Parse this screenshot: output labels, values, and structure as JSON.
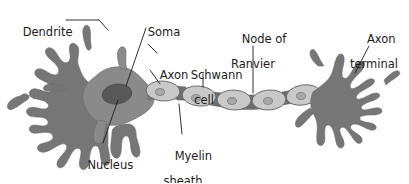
{
  "figure": {
    "background_color": "#ffffff"
  },
  "colors": {
    "dendrite": "#767676",
    "soma": "#8a8a8a",
    "nucleus": "#585858",
    "axon": "#8a8a8a",
    "schwann_cell": "#c9c9c9",
    "schwann_nucleus": "#a0a0a0",
    "node_of_ranvier": "#6e6e6e",
    "terminal": "#767676",
    "outline": "#555555",
    "leader_line": "#1c1c1c",
    "text": "#1c1c1c"
  },
  "labels": {
    "dendrite": {
      "line1": "Dendrite",
      "line2": ""
    },
    "soma": {
      "line1": "Soma",
      "line2": ""
    },
    "axon": {
      "line1": "Axon",
      "line2": ""
    },
    "schwann_cell": {
      "line1": "Schwann",
      "line2": "cell"
    },
    "node_of_ranvier": {
      "line1": "Node of",
      "line2": "Ranvier"
    },
    "axon_terminal": {
      "line1": "Axon",
      "line2": "terminal"
    },
    "nucleus": {
      "line1": "Nucleus",
      "line2": ""
    },
    "myelin_sheath": {
      "line1": "Myelin",
      "line2": "sheath"
    }
  },
  "structures": [
    {
      "name": "dendrite",
      "description": "branched dendritic tree on left of soma"
    },
    {
      "name": "soma",
      "description": "cell body, large rounded star-shaped mass"
    },
    {
      "name": "nucleus",
      "description": "dark oval inside soma"
    },
    {
      "name": "axon",
      "description": "long process extending right from soma"
    },
    {
      "name": "schwann-cell",
      "description": "five oval myelinating cells along axon"
    },
    {
      "name": "myelin-sheath",
      "description": "light oval wrapping around axon"
    },
    {
      "name": "node-of-ranvier",
      "description": "dark gaps between myelin segments"
    },
    {
      "name": "axon-terminal",
      "description": "branched terminal arbor at right end"
    }
  ]
}
